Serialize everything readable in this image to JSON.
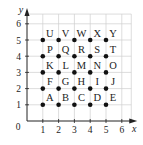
{
  "chart_data": {
    "type": "scatter",
    "title": "",
    "xlabel": "x",
    "ylabel": "y",
    "xlim": [
      0,
      6.6
    ],
    "ylim": [
      0,
      6.6
    ],
    "grid": true,
    "x_ticks": [
      "1",
      "2",
      "3",
      "4",
      "5",
      "6"
    ],
    "y_ticks": [
      "1",
      "2",
      "3",
      "4",
      "5",
      "6"
    ],
    "origin_label": "0",
    "points": [
      {
        "label": "A",
        "x": 1,
        "y": 1
      },
      {
        "label": "B",
        "x": 2,
        "y": 1
      },
      {
        "label": "C",
        "x": 3,
        "y": 1
      },
      {
        "label": "D",
        "x": 4,
        "y": 1
      },
      {
        "label": "E",
        "x": 5,
        "y": 1
      },
      {
        "label": "F",
        "x": 1,
        "y": 2
      },
      {
        "label": "G",
        "x": 2,
        "y": 2
      },
      {
        "label": "H",
        "x": 3,
        "y": 2
      },
      {
        "label": "I",
        "x": 4,
        "y": 2
      },
      {
        "label": "J",
        "x": 5,
        "y": 2
      },
      {
        "label": "K",
        "x": 1,
        "y": 3
      },
      {
        "label": "L",
        "x": 2,
        "y": 3
      },
      {
        "label": "M",
        "x": 3,
        "y": 3
      },
      {
        "label": "N",
        "x": 4,
        "y": 3
      },
      {
        "label": "O",
        "x": 5,
        "y": 3
      },
      {
        "label": "P",
        "x": 1,
        "y": 4
      },
      {
        "label": "Q",
        "x": 2,
        "y": 4
      },
      {
        "label": "R",
        "x": 3,
        "y": 4
      },
      {
        "label": "S",
        "x": 4,
        "y": 4
      },
      {
        "label": "T",
        "x": 5,
        "y": 4
      },
      {
        "label": "U",
        "x": 1,
        "y": 5
      },
      {
        "label": "V",
        "x": 2,
        "y": 5
      },
      {
        "label": "W",
        "x": 3,
        "y": 5
      },
      {
        "label": "X",
        "x": 4,
        "y": 5
      },
      {
        "label": "Y",
        "x": 5,
        "y": 5
      }
    ],
    "colors": {
      "grid": "#cfcfcf",
      "axis": "#222222",
      "point": "#111111"
    }
  }
}
